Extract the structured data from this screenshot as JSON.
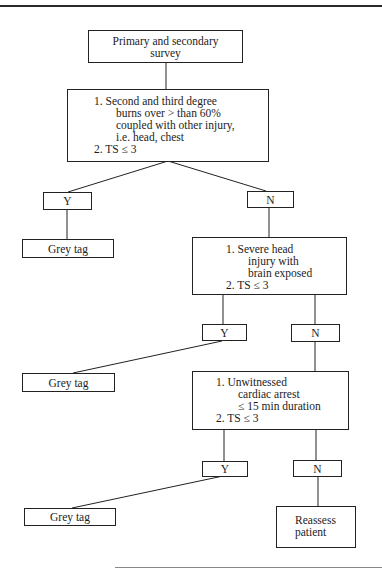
{
  "flowchart": {
    "start": {
      "lines": [
        "Primary and secondary",
        "survey"
      ]
    },
    "decision1": {
      "item1_lines": [
        "1.  Second and third degree",
        "burns over > than 60%",
        "coupled with other injury,",
        "i.e. head, chest"
      ],
      "item2": "2.  TS ≤ 3"
    },
    "decision2": {
      "item1_lines": [
        "1.  Severe head",
        "injury with",
        "brain exposed"
      ],
      "item2": "2.  TS ≤ 3"
    },
    "decision3": {
      "item1_lines": [
        "1.  Unwitnessed",
        "cardiac arrest",
        "≤ 15 min duration"
      ],
      "item2": "2.  TS ≤ 3"
    },
    "yes_label": "Y",
    "no_label": "N",
    "outcome_grey": "Grey tag",
    "outcome_reassess": [
      "Reassess",
      "patient"
    ]
  }
}
